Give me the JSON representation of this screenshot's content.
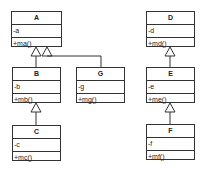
{
  "diagram": {
    "type": "uml-class-diagram",
    "classes": [
      {
        "id": "A",
        "name": "A",
        "attribute": "-a",
        "method": "+ma()",
        "x": 11,
        "y": 11,
        "w": 51,
        "h": 36
      },
      {
        "id": "B",
        "name": "B",
        "attribute": "-b",
        "method": "+mb()",
        "x": 12,
        "y": 67,
        "w": 49,
        "h": 36
      },
      {
        "id": "G",
        "name": "G",
        "attribute": "-g",
        "method": "+mg()",
        "x": 76,
        "y": 67,
        "w": 49,
        "h": 36
      },
      {
        "id": "C",
        "name": "C",
        "attribute": "-c",
        "method": "+mc()",
        "x": 12,
        "y": 125,
        "w": 49,
        "h": 36
      },
      {
        "id": "D",
        "name": "D",
        "attribute": "-d",
        "method": "+md()",
        "x": 146,
        "y": 11,
        "w": 49,
        "h": 36
      },
      {
        "id": "E",
        "name": "E",
        "attribute": "-e",
        "method": "+me()",
        "x": 146,
        "y": 67,
        "w": 49,
        "h": 36
      },
      {
        "id": "F",
        "name": "F",
        "attribute": "-f",
        "method": "+mf()",
        "x": 146,
        "y": 124,
        "w": 49,
        "h": 36
      }
    ],
    "generalizations": [
      {
        "child": "B",
        "parent": "A"
      },
      {
        "child": "G",
        "parent": "A"
      },
      {
        "child": "C",
        "parent": "B"
      },
      {
        "child": "E",
        "parent": "D"
      },
      {
        "child": "F",
        "parent": "E"
      }
    ]
  }
}
